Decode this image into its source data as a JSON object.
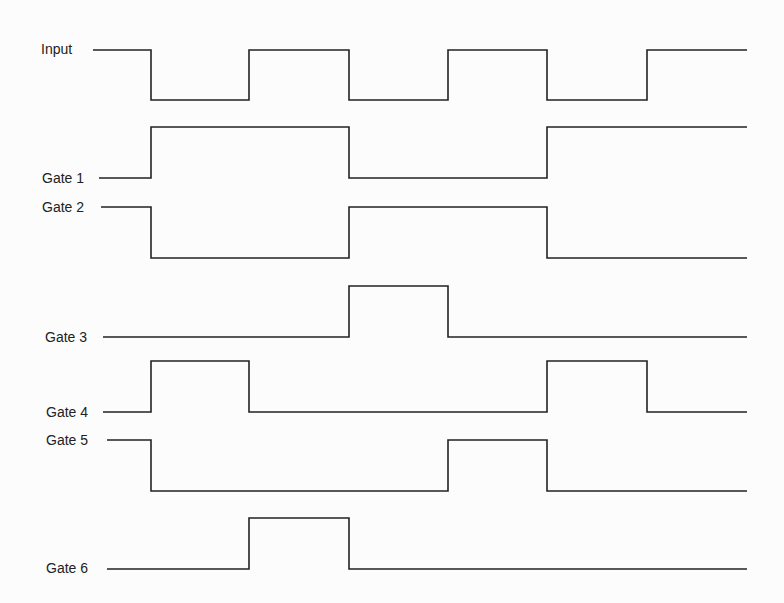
{
  "diagram": {
    "type": "timing-diagram",
    "background": "#fcfcfc",
    "line_color": "#222222",
    "x_end": 747,
    "signals": [
      {
        "name": "Input",
        "label_x": 41,
        "label_y": 41,
        "start_x": 93,
        "high_y": 50,
        "low_y": 100,
        "initial": 1,
        "transitions": [
          151,
          249,
          349,
          448,
          547,
          647
        ]
      },
      {
        "name": "Gate 1",
        "label_x": 42,
        "label_y": 170,
        "start_x": 99,
        "high_y": 127,
        "low_y": 178,
        "initial": 0,
        "transitions": [
          151,
          349,
          547
        ]
      },
      {
        "name": "Gate 2",
        "label_x": 42,
        "label_y": 199,
        "start_x": 101,
        "high_y": 207,
        "low_y": 258,
        "initial": 1,
        "transitions": [
          151,
          349,
          547
        ]
      },
      {
        "name": "Gate 3",
        "label_x": 45,
        "label_y": 329,
        "start_x": 103,
        "high_y": 286,
        "low_y": 337,
        "initial": 0,
        "transitions": [
          349,
          448
        ]
      },
      {
        "name": "Gate 4",
        "label_x": 46,
        "label_y": 404,
        "start_x": 103,
        "high_y": 361,
        "low_y": 412,
        "initial": 0,
        "transitions": [
          151,
          249,
          547,
          647
        ]
      },
      {
        "name": "Gate 5",
        "label_x": 46,
        "label_y": 432,
        "start_x": 107,
        "high_y": 440,
        "low_y": 491,
        "initial": 1,
        "transitions": [
          151,
          448,
          547
        ]
      },
      {
        "name": "Gate 6",
        "label_x": 46,
        "label_y": 560,
        "start_x": 107,
        "high_y": 518,
        "low_y": 569,
        "initial": 0,
        "transitions": [
          249,
          349
        ]
      }
    ]
  }
}
